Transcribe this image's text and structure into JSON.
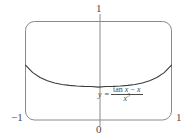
{
  "chart_data": {
    "type": "line",
    "title": "",
    "subtitle": "",
    "xlabel": "",
    "ylabel": "",
    "xlim": [
      -1,
      1
    ],
    "ylim": [
      0,
      1
    ],
    "grid": false,
    "legend_position": "inline-annotation",
    "x_tick_labels": [
      "-1",
      "0",
      "1"
    ],
    "y_tick_labels": [
      "1"
    ],
    "annotations": [
      {
        "name": "curve-equation",
        "text": "y = (tan x - x) / x^3",
        "lhs": "y",
        "relation": "=",
        "numerator": "tan x - x",
        "denominator": "x",
        "denominator_exponent": "3"
      }
    ],
    "series": [
      {
        "name": "y = (tan x - x)/x^3",
        "x": [
          -1.0,
          -0.9,
          -0.8,
          -0.7,
          -0.6,
          -0.5,
          -0.4,
          -0.3,
          -0.2,
          -0.1,
          0.0,
          0.1,
          0.2,
          0.3,
          0.4,
          0.5,
          0.6,
          0.7,
          0.8,
          0.9,
          1.0
        ],
        "y": [
          0.5574,
          0.4808,
          0.431,
          0.398,
          0.3758,
          0.361,
          0.3512,
          0.345,
          0.3414,
          0.34,
          0.3333,
          0.34,
          0.3414,
          0.345,
          0.3512,
          0.361,
          0.3758,
          0.398,
          0.431,
          0.4808,
          0.5574
        ]
      }
    ],
    "frame": {
      "shape": "rounded-rectangle",
      "x_range": [
        -1,
        1
      ],
      "y_range": [
        0,
        1
      ]
    }
  },
  "labels": {
    "y_max": "1",
    "origin": "0",
    "x_min": "−1",
    "x_max": "1"
  },
  "equation": {
    "lhs": "y",
    "relation": "=",
    "numerator_fn": "tan",
    "numerator_var": "x",
    "numerator_op": "−",
    "numerator_term": "x",
    "denominator_var": "x",
    "denominator_exp": "3"
  },
  "colors": {
    "curve": "#3b3b3b",
    "frame": "#8a8a8a",
    "axis": "#8a8a8a",
    "text": "#4a4a4a",
    "background": "#ffffff"
  }
}
